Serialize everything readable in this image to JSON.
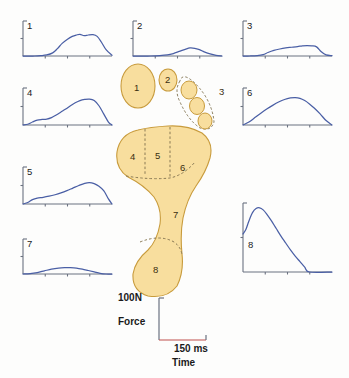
{
  "figure": {
    "colors": {
      "curve": "#4A5FA5",
      "axis": "#6b7280",
      "foot_fill": "#F8DE9E",
      "foot_stroke": "#C89B3C",
      "dashed": "#8a7a55",
      "background": "#fdfdfc",
      "text": "#1a1a1a",
      "baseline_accent": "#c0504d"
    }
  },
  "scale_legend": {
    "force_value": "100N",
    "force_axis_label": "Force",
    "time_value": "150 ms",
    "time_axis_label": "Time"
  },
  "foot_regions": [
    {
      "id": "1",
      "label": "1",
      "name": "hallux-great-toe"
    },
    {
      "id": "2",
      "label": "2",
      "name": "second-toe"
    },
    {
      "id": "3",
      "label": "3",
      "name": "lesser-toes-group"
    },
    {
      "id": "4",
      "label": "4",
      "name": "first-metatarsal-head"
    },
    {
      "id": "5",
      "label": "5",
      "name": "second-metatarsal-head"
    },
    {
      "id": "6",
      "label": "6",
      "name": "lateral-metatarsal-heads"
    },
    {
      "id": "7",
      "label": "7",
      "name": "midfoot"
    },
    {
      "id": "8",
      "label": "8",
      "name": "heel"
    }
  ],
  "chart_data": [
    {
      "type": "line",
      "id": "1",
      "title": "1",
      "xlabel": "Time",
      "ylabel": "Force",
      "xlim": [
        0,
        150
      ],
      "ylim": [
        0,
        100
      ],
      "xticks": [
        0,
        37.5,
        75,
        112.5,
        150
      ],
      "yticks": [
        0,
        50,
        100
      ],
      "grid": false,
      "x": [
        0,
        10,
        20,
        30,
        40,
        50,
        58,
        66,
        75,
        83,
        90,
        96,
        103,
        110,
        118,
        125,
        132,
        140,
        150
      ],
      "y": [
        0,
        0,
        0,
        1,
        3,
        9,
        21,
        36,
        48,
        56,
        60,
        62,
        58,
        60,
        61,
        56,
        40,
        18,
        2
      ]
    },
    {
      "type": "line",
      "id": "2",
      "title": "2",
      "xlabel": "Time",
      "ylabel": "Force",
      "xlim": [
        0,
        150
      ],
      "ylim": [
        0,
        100
      ],
      "xticks": [
        0,
        37.5,
        75,
        112.5,
        150
      ],
      "yticks": [
        0,
        50,
        100
      ],
      "grid": false,
      "x": [
        0,
        15,
        30,
        45,
        58,
        68,
        78,
        88,
        96,
        104,
        112,
        120,
        130,
        140,
        150
      ],
      "y": [
        0,
        0,
        0,
        1,
        3,
        7,
        13,
        19,
        23,
        22,
        18,
        12,
        6,
        2,
        0
      ]
    },
    {
      "type": "line",
      "id": "3",
      "title": "3",
      "xlabel": "Time",
      "ylabel": "Force",
      "xlim": [
        0,
        150
      ],
      "ylim": [
        0,
        100
      ],
      "xticks": [
        0,
        37.5,
        75,
        112.5,
        150
      ],
      "yticks": [
        0,
        50,
        100
      ],
      "grid": false,
      "x": [
        0,
        12,
        24,
        34,
        42,
        52,
        62,
        72,
        82,
        92,
        100,
        108,
        116,
        124,
        132,
        140,
        150
      ],
      "y": [
        0,
        0,
        1,
        4,
        10,
        16,
        20,
        23,
        25,
        27,
        29,
        30,
        29,
        26,
        12,
        3,
        1
      ]
    },
    {
      "type": "line",
      "id": "4",
      "title": "4",
      "xlabel": "Time",
      "ylabel": "Force",
      "xlim": [
        0,
        150
      ],
      "ylim": [
        0,
        100
      ],
      "xticks": [
        0,
        37.5,
        75,
        112.5,
        150
      ],
      "yticks": [
        0,
        50,
        100
      ],
      "grid": false,
      "x": [
        0,
        8,
        16,
        24,
        32,
        40,
        48,
        56,
        64,
        72,
        80,
        88,
        96,
        104,
        112,
        120,
        128,
        136,
        144,
        150
      ],
      "y": [
        0,
        2,
        8,
        13,
        15,
        16,
        20,
        27,
        35,
        43,
        52,
        60,
        66,
        69,
        70,
        66,
        52,
        30,
        8,
        0
      ]
    },
    {
      "type": "line",
      "id": "5",
      "title": "5",
      "xlabel": "Time",
      "ylabel": "Force",
      "xlim": [
        0,
        150
      ],
      "ylim": [
        0,
        100
      ],
      "xticks": [
        0,
        37.5,
        75,
        112.5,
        150
      ],
      "yticks": [
        0,
        50,
        100
      ],
      "grid": false,
      "x": [
        0,
        8,
        16,
        24,
        34,
        44,
        54,
        64,
        74,
        84,
        94,
        104,
        112,
        120,
        128,
        136,
        144,
        150
      ],
      "y": [
        0,
        4,
        12,
        16,
        18,
        21,
        25,
        30,
        36,
        43,
        50,
        56,
        58,
        55,
        48,
        36,
        14,
        0
      ]
    },
    {
      "type": "line",
      "id": "6",
      "title": "6",
      "xlabel": "Time",
      "ylabel": "Force",
      "xlim": [
        0,
        150
      ],
      "ylim": [
        0,
        100
      ],
      "xticks": [
        0,
        37.5,
        75,
        112.5,
        150
      ],
      "yticks": [
        0,
        50,
        100
      ],
      "grid": false,
      "x": [
        0,
        10,
        20,
        30,
        40,
        50,
        60,
        70,
        80,
        88,
        96,
        104,
        112,
        120,
        130,
        140,
        150
      ],
      "y": [
        0,
        8,
        20,
        32,
        43,
        53,
        62,
        69,
        73,
        74,
        72,
        66,
        57,
        46,
        30,
        12,
        0
      ]
    },
    {
      "type": "line",
      "id": "7",
      "title": "7",
      "xlabel": "Time",
      "ylabel": "Force",
      "xlim": [
        0,
        150
      ],
      "ylim": [
        0,
        100
      ],
      "xticks": [
        0,
        37.5,
        75,
        112.5,
        150
      ],
      "yticks": [
        0,
        50,
        100
      ],
      "grid": false,
      "x": [
        0,
        12,
        24,
        36,
        48,
        60,
        70,
        80,
        90,
        100,
        110,
        120,
        130,
        140,
        150
      ],
      "y": [
        0,
        1,
        4,
        9,
        14,
        17,
        18,
        18,
        17,
        14,
        10,
        6,
        2,
        0,
        0
      ]
    },
    {
      "type": "line",
      "id": "8",
      "title": "8",
      "xlabel": "Time",
      "ylabel": "Force",
      "xlim": [
        0,
        150
      ],
      "ylim": [
        0,
        100
      ],
      "xticks": [
        0,
        37.5,
        75,
        112.5,
        150
      ],
      "yticks": [
        0,
        50,
        100
      ],
      "grid": false,
      "x": [
        0,
        5,
        10,
        16,
        22,
        28,
        34,
        40,
        48,
        56,
        64,
        72,
        80,
        88,
        96,
        104,
        112,
        150
      ],
      "y": [
        55,
        62,
        74,
        86,
        92,
        93,
        90,
        84,
        74,
        63,
        52,
        42,
        32,
        23,
        15,
        7,
        0,
        0
      ]
    }
  ]
}
